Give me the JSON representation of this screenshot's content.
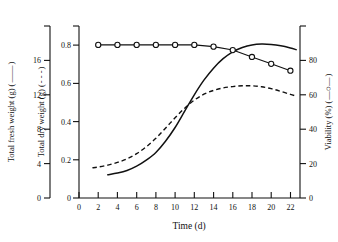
{
  "chart_data": {
    "type": "line",
    "title": "",
    "xlabel": "Time (d)",
    "xlim": [
      0,
      23
    ],
    "xticks": [
      0,
      2,
      4,
      6,
      8,
      10,
      12,
      14,
      16,
      18,
      20,
      22
    ],
    "xticklabels": [
      "0",
      "2",
      "4",
      "6",
      "8",
      "10",
      "12",
      "14",
      "16",
      "18",
      "20",
      "22"
    ],
    "grid": false,
    "legend_position": "axis-titles",
    "axes": [
      {
        "id": "fresh_weight",
        "position": "left-outer",
        "label": "Total fresh weight (g) (",
        "label_suffix": ")",
        "legend_marker": "solid-line",
        "ylim": [
          0,
          20
        ],
        "yticks": [
          0,
          4,
          8,
          12,
          16
        ],
        "yticklabels": [
          "0",
          "4",
          "8",
          "12",
          "16"
        ]
      },
      {
        "id": "dry_weight",
        "position": "left-inner",
        "label": "Total dry weight (g) (",
        "label_suffix": ")",
        "legend_marker": "dashed-line",
        "ylim": [
          0,
          0.9
        ],
        "yticks": [
          0,
          0.2,
          0.4,
          0.6,
          0.8
        ],
        "yticklabels": [
          "0",
          "0.2",
          "0.4",
          "0.6",
          "0.8"
        ]
      },
      {
        "id": "viability",
        "position": "right",
        "label": "Viability (%) (",
        "label_suffix": ")",
        "legend_marker": "circle-line",
        "ylim": [
          0,
          100
        ],
        "yticks": [
          0,
          20,
          40,
          60,
          80
        ],
        "yticklabels": [
          "0",
          "20",
          "40",
          "60",
          "80"
        ]
      }
    ],
    "series": [
      {
        "name": "Total fresh weight (g)",
        "axis": "fresh_weight",
        "style": "solid",
        "marker": "none",
        "color": "#111111",
        "x": [
          3,
          4,
          5,
          6,
          7,
          8,
          9,
          10,
          11,
          12,
          13,
          14,
          15,
          16,
          17,
          18,
          19,
          20,
          21,
          22,
          22.6
        ],
        "values": [
          2.7,
          2.9,
          3.2,
          3.7,
          4.4,
          5.3,
          6.6,
          8.2,
          10.1,
          12.0,
          13.7,
          15.1,
          16.2,
          17.0,
          17.5,
          17.8,
          17.9,
          17.85,
          17.7,
          17.45,
          17.25
        ]
      },
      {
        "name": "Total dry weight (g)",
        "axis": "dry_weight",
        "style": "dashed",
        "marker": "none",
        "color": "#111111",
        "x": [
          1.4,
          2,
          3,
          4,
          5,
          6,
          7,
          8,
          9,
          10,
          11,
          12,
          13,
          14,
          15,
          16,
          17,
          18,
          19,
          20,
          21,
          22,
          22.5
        ],
        "values": [
          0.158,
          0.162,
          0.172,
          0.186,
          0.205,
          0.232,
          0.268,
          0.312,
          0.365,
          0.42,
          0.47,
          0.512,
          0.543,
          0.563,
          0.576,
          0.583,
          0.587,
          0.587,
          0.582,
          0.572,
          0.558,
          0.542,
          0.535
        ]
      },
      {
        "name": "Viability (%)",
        "axis": "viability",
        "style": "solid",
        "marker": "open-circle",
        "color": "#111111",
        "x": [
          2,
          4,
          6,
          8,
          10,
          12,
          14,
          16,
          18,
          20,
          22
        ],
        "values": [
          89,
          89,
          89,
          89,
          89,
          89,
          88,
          86,
          82,
          78,
          74
        ]
      }
    ]
  }
}
